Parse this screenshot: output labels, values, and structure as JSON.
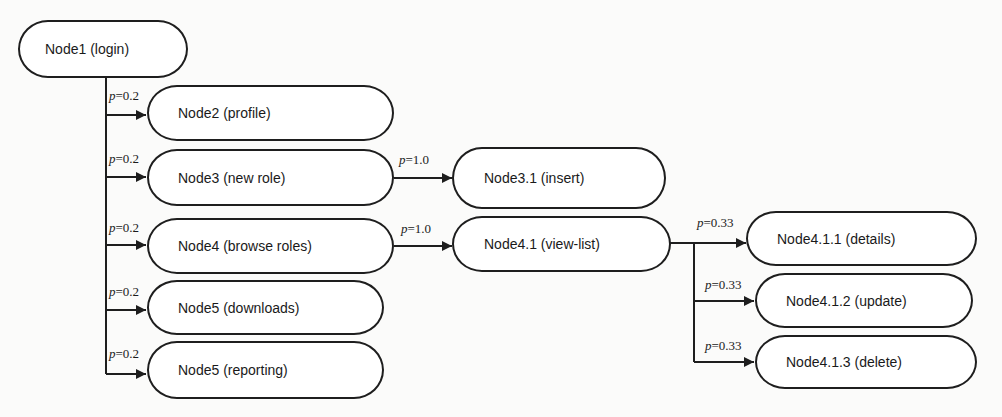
{
  "diagram": {
    "nodes": [
      {
        "id": "node1",
        "label": "Node1 (login)"
      },
      {
        "id": "node2",
        "label": "Node2 (profile)"
      },
      {
        "id": "node3",
        "label": "Node3 (new role)"
      },
      {
        "id": "node4",
        "label": "Node4 (browse roles)"
      },
      {
        "id": "node5a",
        "label": "Node5 (downloads)"
      },
      {
        "id": "node5b",
        "label": "Node5 (reporting)"
      },
      {
        "id": "node3_1",
        "label": "Node3.1 (insert)"
      },
      {
        "id": "node4_1",
        "label": "Node4.1 (view-list)"
      },
      {
        "id": "node4_1_1",
        "label": "Node4.1.1 (details)"
      },
      {
        "id": "node4_1_2",
        "label": "Node4.1.2 (update)"
      },
      {
        "id": "node4_1_3",
        "label": "Node4.1.3 (delete)"
      }
    ],
    "edges": [
      {
        "from": "node1",
        "to": "node2",
        "p_var": "p",
        "p_val": "=0.2"
      },
      {
        "from": "node1",
        "to": "node3",
        "p_var": "p",
        "p_val": "=0.2"
      },
      {
        "from": "node1",
        "to": "node4",
        "p_var": "p",
        "p_val": "=0.2"
      },
      {
        "from": "node1",
        "to": "node5a",
        "p_var": "p",
        "p_val": "=0.2"
      },
      {
        "from": "node1",
        "to": "node5b",
        "p_var": "p",
        "p_val": "=0.2"
      },
      {
        "from": "node3",
        "to": "node3_1",
        "p_var": "p",
        "p_val": "=1.0"
      },
      {
        "from": "node4",
        "to": "node4_1",
        "p_var": "p",
        "p_val": "=1.0"
      },
      {
        "from": "node4_1",
        "to": "node4_1_1",
        "p_var": "p",
        "p_val": "=0.33"
      },
      {
        "from": "node4_1",
        "to": "node4_1_2",
        "p_var": "p",
        "p_val": "=0.33"
      },
      {
        "from": "node4_1",
        "to": "node4_1_3",
        "p_var": "p",
        "p_val": "=0.33"
      }
    ]
  }
}
